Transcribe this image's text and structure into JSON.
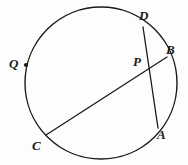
{
  "figure": {
    "kind": "circle-geometry-diagram",
    "background_color": "#fdfdfd",
    "stroke_color": "#1a1a1a",
    "label_color": "#1a1a1a"
  },
  "circle": {
    "name": "main-circle",
    "center_x": 101,
    "center_y": 83,
    "radius": 76,
    "stroke_width": 1.4
  },
  "points": {
    "A": {
      "label": "A",
      "x": 158,
      "y": 128,
      "label_x": 157,
      "label_y": 128,
      "on_circle": true
    },
    "B": {
      "label": "B",
      "x": 167,
      "y": 57,
      "label_x": 166,
      "label_y": 43,
      "on_circle": true
    },
    "C": {
      "label": "C",
      "x": 46,
      "y": 135,
      "label_x": 32,
      "label_y": 139,
      "on_circle": true
    },
    "D": {
      "label": "D",
      "x": 143,
      "y": 27,
      "label_x": 139,
      "label_y": 9,
      "on_circle": true
    },
    "P": {
      "label": "P",
      "x": 148,
      "y": 68,
      "label_x": 133,
      "label_y": 55,
      "on_circle": false
    },
    "Q": {
      "label": "Q",
      "x": 26,
      "y": 65,
      "label_x": 9,
      "label_y": 57,
      "on_circle": true,
      "marked": true
    }
  },
  "chords": [
    {
      "name": "chord-CB",
      "from": "C",
      "to": "B",
      "x1": 46,
      "y1": 135,
      "x2": 167,
      "y2": 57
    },
    {
      "name": "chord-DA",
      "from": "D",
      "to": "A",
      "x1": 143,
      "y1": 27,
      "x2": 158,
      "y2": 128
    }
  ],
  "markers": [
    {
      "name": "point-marker-Q",
      "x": 26,
      "y": 65,
      "r": 2.1
    }
  ]
}
